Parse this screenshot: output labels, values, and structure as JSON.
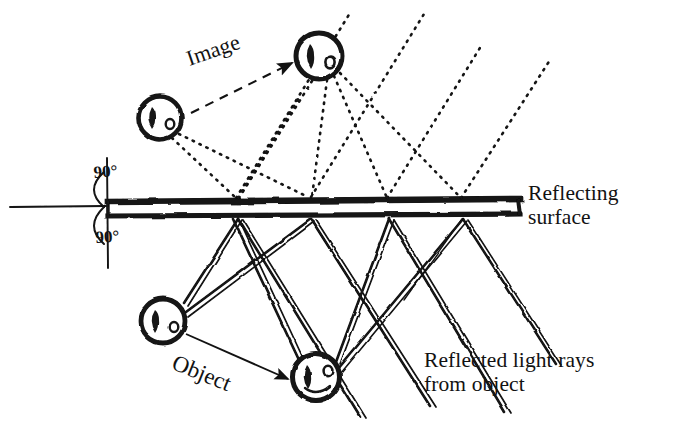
{
  "figure": {
    "background_color": "#ffffff",
    "ink_color": "#121212",
    "width": 677,
    "height": 431
  },
  "labels": {
    "reflecting_surface": "Reflecting\nsurface",
    "reflected_rays": "Reflected light rays\nfrom object",
    "image": "Image",
    "object": "Object",
    "angle_top": "90°",
    "angle_bottom": "90°"
  },
  "mirror": {
    "name": "reflecting-surface-bar",
    "x_start": 106,
    "x_end": 521,
    "y_top": 199,
    "y_bottom": 216,
    "stroke_color": "#121212"
  },
  "normal_line": {
    "x": 107,
    "y_top": 158,
    "y_bottom": 268,
    "extension_x_start": 8,
    "extension_y": 207
  },
  "faces": [
    {
      "name": "image-face-left",
      "kind": "image",
      "cx": 160,
      "cy": 118,
      "r": 22,
      "expression": "neutral"
    },
    {
      "name": "image-face-right",
      "kind": "image",
      "cx": 319,
      "cy": 56,
      "r": 24,
      "expression": "neutral"
    },
    {
      "name": "object-face-left",
      "cx": 163,
      "cy": 321,
      "r": 23,
      "kind": "object",
      "expression": "neutral"
    },
    {
      "name": "object-face-right",
      "cx": 316,
      "cy": 377,
      "r": 24,
      "kind": "object",
      "expression": "smile"
    }
  ],
  "virtual_rays": {
    "style": "dotted",
    "description": "Dotted construction lines from virtual images down to mirror contact points and continuing up-right as reflected ray extensions",
    "contact_points_x": [
      237,
      311,
      388,
      462
    ],
    "mirror_y": 200
  },
  "real_rays": {
    "style": "solid-double",
    "description": "Solid light rays from object up to mirror, reflecting down-right",
    "contact_points_x": [
      237,
      311,
      388,
      462
    ],
    "mirror_y": 216
  },
  "arrows": {
    "image_arrow": {
      "name": "image-pointer-arrow",
      "style": "dashed",
      "from_x": 191,
      "from_y": 113,
      "to_x": 296,
      "to_y": 62
    },
    "object_arrow": {
      "name": "object-pointer-arrow",
      "style": "solid",
      "from_x": 185,
      "from_y": 333,
      "to_x": 292,
      "to_y": 380
    }
  }
}
